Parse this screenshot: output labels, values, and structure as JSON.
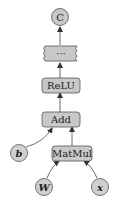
{
  "diagram": {
    "type": "computation-graph",
    "nodes": {
      "output": {
        "label": "C",
        "shape": "circle"
      },
      "ellipsis": {
        "label": "···",
        "shape": "wavy-rect"
      },
      "relu": {
        "label": "ReLU",
        "shape": "rounded-rect"
      },
      "add": {
        "label": "Add",
        "shape": "rounded-rect"
      },
      "matmul": {
        "label": "MatMul",
        "shape": "rounded-rect"
      },
      "b": {
        "label": "b",
        "shape": "circle"
      },
      "W": {
        "label": "W",
        "shape": "circle"
      },
      "x": {
        "label": "x",
        "shape": "circle"
      }
    },
    "edges": [
      {
        "from": "W",
        "to": "matmul"
      },
      {
        "from": "x",
        "to": "matmul"
      },
      {
        "from": "matmul",
        "to": "add"
      },
      {
        "from": "b",
        "to": "add"
      },
      {
        "from": "add",
        "to": "relu"
      },
      {
        "from": "relu",
        "to": "ellipsis"
      },
      {
        "from": "ellipsis",
        "to": "output"
      }
    ],
    "colors": {
      "node_fill": "#c8c8c8",
      "node_stroke": "#555555",
      "edge": "#444444"
    }
  }
}
